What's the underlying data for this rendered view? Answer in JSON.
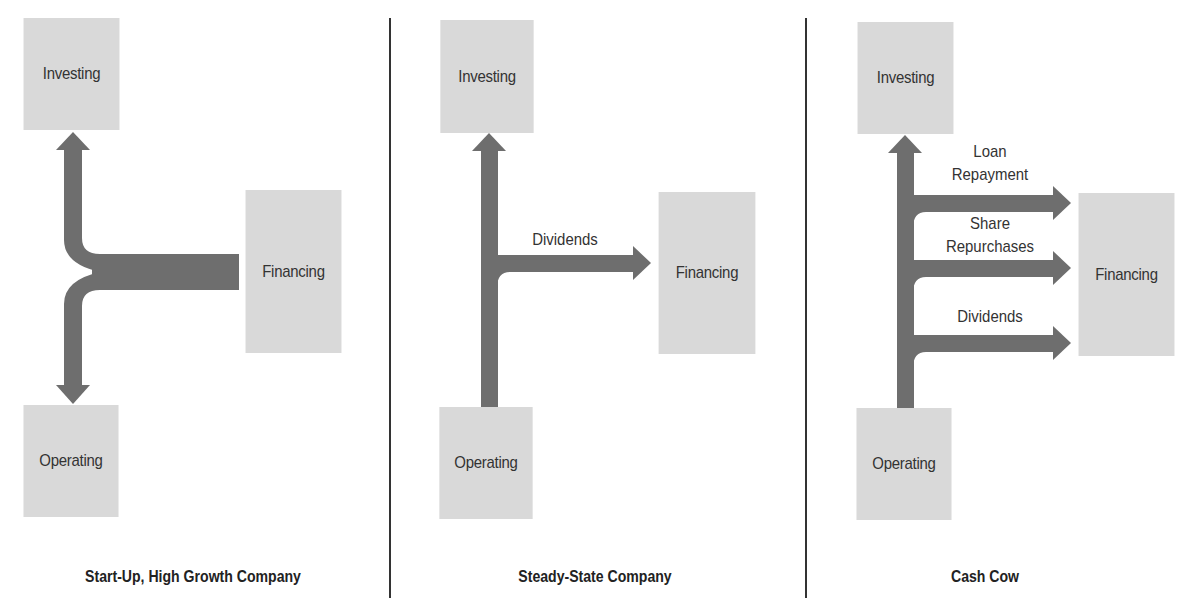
{
  "colors": {
    "box_fill": "#d9d9d9",
    "arrow_fill": "#6e6e6e",
    "divider": "#333333",
    "text": "#333333"
  },
  "panels": [
    {
      "caption": "Start-Up, High Growth Company",
      "boxes": {
        "investing": "Investing",
        "financing": "Financing",
        "operating": "Operating"
      },
      "flows": [
        {
          "from": "Financing",
          "to": "Investing",
          "label": ""
        },
        {
          "from": "Financing",
          "to": "Operating",
          "label": ""
        }
      ]
    },
    {
      "caption": "Steady-State Company",
      "boxes": {
        "investing": "Investing",
        "financing": "Financing",
        "operating": "Operating"
      },
      "flows": [
        {
          "from": "Operating",
          "to": "Investing",
          "label": ""
        },
        {
          "from": "Operating",
          "to": "Financing",
          "label": "Dividends"
        }
      ]
    },
    {
      "caption": "Cash Cow",
      "boxes": {
        "investing": "Investing",
        "financing": "Financing",
        "operating": "Operating"
      },
      "flows": [
        {
          "from": "Operating",
          "to": "Investing",
          "label": ""
        },
        {
          "from": "Operating",
          "to": "Financing",
          "label_line1": "Loan",
          "label_line2": "Repayment"
        },
        {
          "from": "Operating",
          "to": "Financing",
          "label_line1": "Share",
          "label_line2": "Repurchases"
        },
        {
          "from": "Operating",
          "to": "Financing",
          "label": "Dividends"
        }
      ]
    }
  ]
}
